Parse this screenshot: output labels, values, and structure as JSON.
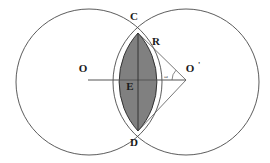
{
  "figure": {
    "name": "two-intersecting-circles-lens-diagram",
    "background_color": "#ffffff",
    "stroke_color": "#4a4a4a",
    "lens_fill_color": "#808080",
    "lens_stroke_color": "#333333",
    "label_color": "#1a1a1a"
  },
  "labels": {
    "center_left": "O",
    "center_right": "O",
    "center_right_prime": "'",
    "top_intersection": "C",
    "bottom_intersection": "D",
    "chord_midpoint": "E",
    "radius": "R",
    "angle": "ω"
  },
  "geometry": {
    "left_circle": {
      "cx": 89,
      "cy": 82,
      "r": 73
    },
    "right_circle": {
      "cx": 186,
      "cy": 82,
      "r": 73
    },
    "top_intersection": {
      "x": 138,
      "y": 33
    },
    "bottom_intersection": {
      "x": 138,
      "y": 131
    },
    "chord_midpoint": {
      "x": 138,
      "y": 82
    },
    "center_line": {
      "x1": 88,
      "y1": 80,
      "x2": 186,
      "y2": 80
    },
    "radius_segment_top": {
      "x1": 138,
      "y1": 33,
      "x2": 186,
      "y2": 80
    },
    "radius_segment_bottom": {
      "x1": 138,
      "y1": 131,
      "x2": 186,
      "y2": 80
    },
    "chord_segment": {
      "x1": 138,
      "y1": 33,
      "x2": 138,
      "y2": 131
    }
  },
  "label_positions": {
    "center_left": {
      "x": 83,
      "y": 72
    },
    "center_right": {
      "x": 190,
      "y": 72
    },
    "center_right_prime": {
      "x": 199,
      "y": 68
    },
    "top_intersection": {
      "x": 134,
      "y": 20
    },
    "bottom_intersection": {
      "x": 134,
      "y": 146
    },
    "chord_midpoint": {
      "x": 130,
      "y": 90
    },
    "radius": {
      "x": 156,
      "y": 45
    },
    "angle": {
      "x": 166,
      "y": 78
    }
  }
}
